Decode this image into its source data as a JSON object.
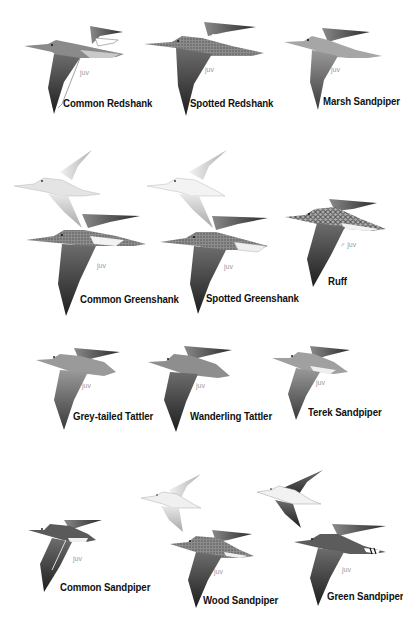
{
  "plate": {
    "background": "#ffffff",
    "species": [
      {
        "name": "Common Redshank",
        "age_label": "juv"
      },
      {
        "name": "Spotted Redshank",
        "age_label": "juv"
      },
      {
        "name": "Marsh Sandpiper",
        "age_label": "juv"
      },
      {
        "name": "Common Greenshank",
        "age_label": "juv"
      },
      {
        "name": "Spotted Greenshank",
        "age_label": "juv"
      },
      {
        "name": "Ruff",
        "age_label": "♂ juv"
      },
      {
        "name": "Grey-tailed Tattler",
        "age_label": "juv"
      },
      {
        "name": "Wanderling Tattler",
        "age_label": "juv"
      },
      {
        "name": "Terek Sandpiper",
        "age_label": "juv"
      },
      {
        "name": "Common Sandpiper",
        "age_label": "juv"
      },
      {
        "name": "Wood Sandpiper",
        "age_label": "juv"
      },
      {
        "name": "Green Sandpiper",
        "age_label": "juv"
      }
    ]
  }
}
